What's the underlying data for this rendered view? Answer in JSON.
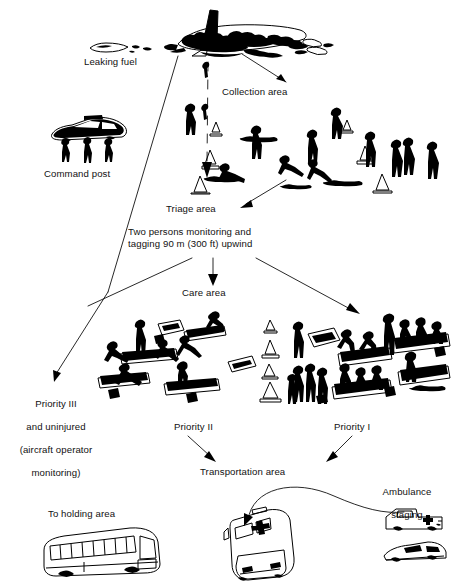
{
  "figure": {
    "type": "diagram",
    "background_color": "#ffffff",
    "ink_color": "#000000"
  },
  "labels": {
    "leaking_fuel": "Leaking fuel",
    "collection_area": "Collection area",
    "command_post": "Command post",
    "triage_area": "Triage area",
    "monitoring_note_line1": "Two persons monitoring and",
    "monitoring_note_line2": "tagging 90 m (300 ft) upwind",
    "care_area": "Care area",
    "priority_iii_line1": "Priority III",
    "priority_iii_line2": "and uninjured",
    "priority_iii_line3": "(aircraft operator",
    "priority_iii_line4": "monitoring)",
    "priority_ii": "Priority II",
    "priority_i": "Priority I",
    "transportation_area": "Transportation area",
    "ambulance_staging_line1": "Ambulance",
    "ambulance_staging_line2": "staging",
    "to_holding_area": "To holding area"
  },
  "icons": {
    "wrecked_airliner": "wrecked-airliner-icon",
    "fuel_slick": "fuel-slick-icon",
    "police_car": "police-car-icon",
    "standing_person": "standing-person-icon",
    "kneeling_attendant": "kneeling-attendant-icon",
    "supine_casualty": "supine-casualty-icon",
    "traffic_cone": "traffic-cone-icon",
    "stretcher": "stretcher-icon",
    "medical_kit": "medical-kit-icon",
    "ambulance_bus": "ambulance-bus-icon",
    "ambulance_van": "ambulance-van-icon",
    "rescue_car": "rescue-car-icon",
    "coach_bus": "coach-bus-icon",
    "arrow": "arrow-icon",
    "boundary_line": "boundary-line-icon",
    "dashed_wind_arrow": "dashed-wind-arrow-icon",
    "curved_route": "curved-route-icon"
  },
  "flow": {
    "arrows": [
      {
        "name": "to-collection-area",
        "from": "wreckage",
        "to": "collection_area"
      },
      {
        "name": "to-triage-area",
        "from": "wreckage",
        "to": "triage_area"
      },
      {
        "name": "triage-inbound",
        "from": "triage_field",
        "to": "triage_area"
      },
      {
        "name": "to-care-area",
        "from": "monitoring_note",
        "to": "care_area"
      },
      {
        "name": "to-priority-iii",
        "from": "care_area",
        "to": "priority_iii"
      },
      {
        "name": "to-priority-i",
        "from": "care_area",
        "to": "priority_i"
      },
      {
        "name": "priority-ii-to-transport",
        "from": "priority_ii",
        "to": "transportation_area"
      },
      {
        "name": "priority-i-to-transport",
        "from": "priority_i",
        "to": "transportation_area"
      },
      {
        "name": "ambulance-staging-route",
        "from": "ambulance_staging",
        "to": "transportation_area"
      }
    ]
  }
}
